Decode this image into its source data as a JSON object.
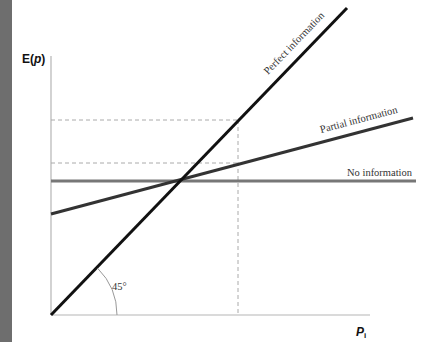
{
  "diagram": {
    "y_axis_label": {
      "main": "E(",
      "var": "p",
      "close": ")"
    },
    "x_axis_label": {
      "main": "P",
      "sub": "i"
    },
    "lines": [
      {
        "label": "Perfect information",
        "color": "#111111"
      },
      {
        "label": "Partial information",
        "color": "#333333"
      },
      {
        "label": "No information",
        "color": "#777777"
      }
    ],
    "angle_label": "45°",
    "colors": {
      "sidebar": "#6e6e6e",
      "axis": "#b5b5b5",
      "dashed": "#aaaaaa"
    }
  }
}
